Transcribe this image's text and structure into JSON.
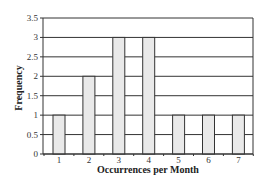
{
  "chart_data": {
    "type": "bar",
    "title": "",
    "xlabel": "Occurrences per Month",
    "ylabel": "Frequency",
    "categories": [
      "1",
      "2",
      "3",
      "4",
      "5",
      "6",
      "7"
    ],
    "values": [
      1,
      2,
      3,
      3,
      1,
      1,
      1
    ],
    "ylim": [
      0,
      3.5
    ],
    "yticks": [
      "0",
      "0.5",
      "1",
      "1.5",
      "2",
      "2.5",
      "3",
      "3.5"
    ],
    "grid": true,
    "legend": null,
    "colors": {
      "bar_fill": "#e9e9e9",
      "bar_stroke": "#333333",
      "grid": "#333333",
      "axis": "#333333"
    }
  }
}
